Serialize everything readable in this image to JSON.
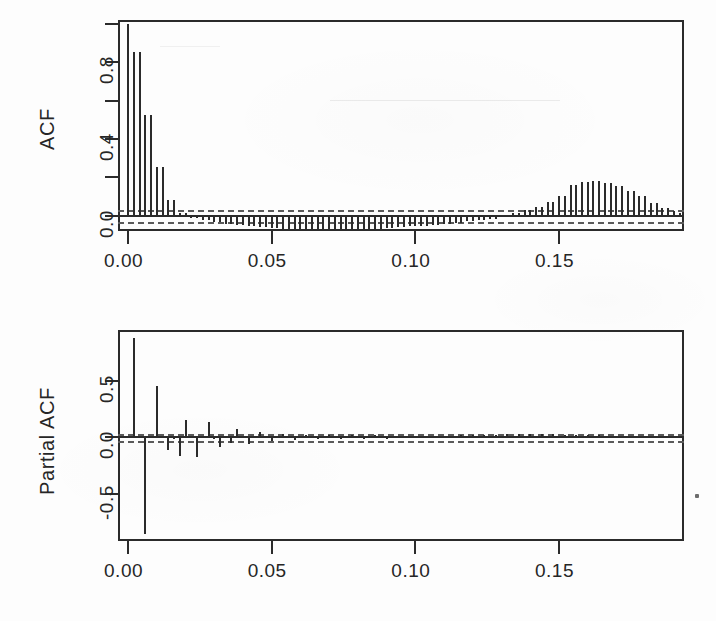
{
  "figure": {
    "kind": "acf-pacf-correlogram-pair",
    "background_color": "#fdfdfd",
    "ink_color": "#2b2b2b",
    "ci_color": "#5a5a5a"
  },
  "chart_data": [
    {
      "type": "bar",
      "id": "acf",
      "title": "",
      "xlabel": "",
      "ylabel": "ACF",
      "xlim": [
        -0.0035,
        0.1935
      ],
      "ylim": [
        -0.08,
        1.02
      ],
      "xticks": [
        0.0,
        0.05,
        0.1,
        0.15
      ],
      "xticklabels": [
        "0.00",
        "0.05",
        "0.10",
        "0.15"
      ],
      "yticks": [
        0.0,
        0.4,
        0.8
      ],
      "yticklabels": [
        "0.0",
        "0.4",
        "0.8"
      ],
      "yticks_minor": [
        0.2,
        0.6,
        1.0
      ],
      "grid": false,
      "legend": null,
      "zero_line": 0.0,
      "conf_level": 0.95,
      "conf_bounds": [
        -0.031,
        0.031
      ],
      "lag_step": 0.002,
      "x": [
        0.0,
        0.002,
        0.004,
        0.006,
        0.008,
        0.01,
        0.012,
        0.014,
        0.016,
        0.018,
        0.02,
        0.022,
        0.024,
        0.026,
        0.028,
        0.03,
        0.032,
        0.034,
        0.036,
        0.038,
        0.04,
        0.042,
        0.044,
        0.046,
        0.048,
        0.05,
        0.052,
        0.054,
        0.056,
        0.058,
        0.06,
        0.062,
        0.064,
        0.066,
        0.068,
        0.07,
        0.072,
        0.074,
        0.076,
        0.078,
        0.08,
        0.082,
        0.084,
        0.086,
        0.088,
        0.09,
        0.092,
        0.094,
        0.096,
        0.098,
        0.1,
        0.102,
        0.104,
        0.106,
        0.108,
        0.11,
        0.112,
        0.114,
        0.116,
        0.118,
        0.12,
        0.122,
        0.124,
        0.126,
        0.128,
        0.13,
        0.132,
        0.134,
        0.136,
        0.138,
        0.14,
        0.142,
        0.144,
        0.146,
        0.148,
        0.15,
        0.152,
        0.154,
        0.156,
        0.158,
        0.16,
        0.162,
        0.164,
        0.166,
        0.168,
        0.17,
        0.172,
        0.174,
        0.176,
        0.178,
        0.18,
        0.182,
        0.184,
        0.186,
        0.188,
        0.19,
        0.192
      ],
      "values": [
        1.0,
        0.855,
        0.855,
        0.525,
        0.525,
        0.255,
        0.255,
        0.08,
        0.08,
        0.015,
        0.015,
        -0.01,
        -0.01,
        -0.025,
        -0.025,
        -0.035,
        -0.035,
        -0.045,
        -0.045,
        -0.05,
        -0.05,
        -0.055,
        -0.055,
        -0.06,
        -0.06,
        -0.065,
        -0.065,
        -0.068,
        -0.068,
        -0.07,
        -0.07,
        -0.072,
        -0.072,
        -0.074,
        -0.074,
        -0.075,
        -0.075,
        -0.074,
        -0.074,
        -0.072,
        -0.072,
        -0.07,
        -0.07,
        -0.068,
        -0.068,
        -0.065,
        -0.065,
        -0.06,
        -0.06,
        -0.056,
        -0.056,
        -0.052,
        -0.052,
        -0.048,
        -0.048,
        -0.042,
        -0.042,
        -0.036,
        -0.036,
        -0.03,
        -0.03,
        -0.024,
        -0.024,
        -0.016,
        -0.016,
        -0.008,
        0.0,
        0.012,
        0.012,
        0.028,
        0.028,
        0.045,
        0.045,
        0.07,
        0.07,
        0.105,
        0.105,
        0.16,
        0.16,
        0.175,
        0.175,
        0.18,
        0.18,
        0.17,
        0.17,
        0.155,
        0.155,
        0.13,
        0.13,
        0.1,
        0.1,
        0.068,
        0.068,
        0.04,
        0.04,
        0.022,
        0.012
      ]
    },
    {
      "type": "bar",
      "id": "pacf",
      "title": "",
      "xlabel": "",
      "ylabel": "Partial ACF",
      "xlim": [
        -0.0035,
        0.1935
      ],
      "ylim": [
        -0.92,
        0.95
      ],
      "xticks": [
        0.0,
        0.05,
        0.1,
        0.15
      ],
      "xticklabels": [
        "0.00",
        "0.05",
        "0.10",
        "0.15"
      ],
      "yticks": [
        -0.5,
        0.0,
        0.5
      ],
      "yticklabels": [
        "-0.5",
        "0.0",
        "0.5"
      ],
      "grid": false,
      "legend": null,
      "zero_line": 0.0,
      "conf_level": 0.95,
      "conf_bounds": [
        -0.031,
        0.031
      ],
      "lag_step": 0.002,
      "x": [
        0.002,
        0.004,
        0.006,
        0.008,
        0.01,
        0.012,
        0.014,
        0.016,
        0.018,
        0.02,
        0.022,
        0.024,
        0.026,
        0.028,
        0.03,
        0.032,
        0.034,
        0.036,
        0.038,
        0.04,
        0.042,
        0.044,
        0.046,
        0.048,
        0.05,
        0.052,
        0.054,
        0.056,
        0.058,
        0.06,
        0.062,
        0.064,
        0.066,
        0.068,
        0.07,
        0.072,
        0.074,
        0.076,
        0.078,
        0.08,
        0.082,
        0.084,
        0.086,
        0.088,
        0.09,
        0.092,
        0.094,
        0.096,
        0.098,
        0.1,
        0.102,
        0.104,
        0.106,
        0.108,
        0.11,
        0.112,
        0.114,
        0.116,
        0.118,
        0.12,
        0.122,
        0.124,
        0.126,
        0.128,
        0.13,
        0.132,
        0.134,
        0.136,
        0.138,
        0.14,
        0.142,
        0.144,
        0.146,
        0.148,
        0.15,
        0.152,
        0.154,
        0.156,
        0.158,
        0.16,
        0.162,
        0.164,
        0.166,
        0.168,
        0.17,
        0.172,
        0.174,
        0.176,
        0.178,
        0.18,
        0.182,
        0.184,
        0.186,
        0.188,
        0.19,
        0.192
      ],
      "values": [
        0.88,
        0.01,
        -0.86,
        0.01,
        0.455,
        0.012,
        -0.11,
        -0.012,
        -0.17,
        0.15,
        0.01,
        -0.175,
        0.01,
        0.135,
        -0.02,
        -0.09,
        0.008,
        -0.055,
        0.07,
        0.01,
        -0.06,
        -0.01,
        0.05,
        0.01,
        -0.038,
        0.012,
        0.03,
        0.01,
        -0.025,
        0.01,
        0.022,
        -0.01,
        -0.018,
        0.012,
        0.02,
        0.01,
        -0.016,
        0.01,
        0.018,
        0.01,
        -0.014,
        0.01,
        0.016,
        0.01,
        -0.012,
        0.01,
        0.015,
        0.01,
        0.014,
        0.01,
        0.013,
        0.01,
        0.012,
        0.014,
        0.01,
        0.012,
        0.01,
        0.016,
        0.01,
        0.018,
        0.01,
        0.02,
        0.012,
        0.022,
        0.012,
        0.024,
        0.014,
        0.026,
        0.014,
        0.028,
        0.012,
        0.026,
        0.012,
        0.024,
        0.012,
        0.022,
        0.01,
        0.02,
        0.01,
        0.018,
        0.01,
        0.016,
        0.01,
        0.014,
        0.01,
        0.013,
        0.01,
        0.012,
        0.01,
        0.012,
        0.01,
        0.012,
        0.01,
        0.012,
        0.01,
        0.012,
        0.01
      ]
    }
  ],
  "geometry": {
    "acf_frame": {
      "left": 118,
      "top": 20,
      "width": 566,
      "height": 211
    },
    "pacf_frame": {
      "left": 118,
      "top": 330,
      "width": 566,
      "height": 211
    }
  },
  "labels": {
    "acf_axis_title": "ACF",
    "pacf_axis_title": "Partial ACF",
    "acf_yticks": [
      "0.0",
      "0.4",
      "0.8"
    ],
    "pacf_yticks": [
      "-0.5",
      "0.0",
      "0.5"
    ],
    "xticks": [
      "0.00",
      "0.05",
      "0.10",
      "0.15"
    ]
  }
}
